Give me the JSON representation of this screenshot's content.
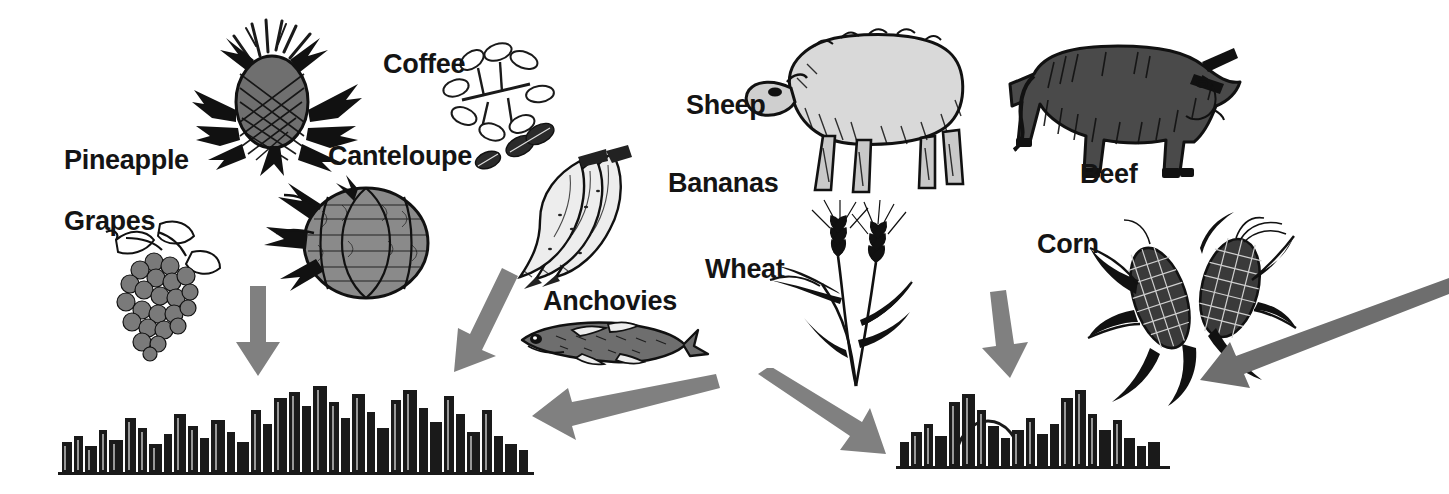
{
  "diagram": {
    "background_color": "#FFFFFF",
    "label_color": "#141414",
    "arrow_color": "#808080",
    "arrow_color_dark": "#6E6E6E",
    "ink_color": "#1A1A1A",
    "fill_gray": "#808080",
    "fill_light": "#D9D9D9",
    "fill_dark": "#4D4D4D"
  },
  "labels": [
    {
      "id": "pineapple",
      "text": "Pineapple",
      "x": 64,
      "y": 147
    },
    {
      "id": "coffee",
      "text": "Coffee",
      "x": 383,
      "y": 51
    },
    {
      "id": "canteloupe",
      "text": "Canteloupe",
      "x": 328,
      "y": 143
    },
    {
      "id": "grapes",
      "text": "Grapes",
      "x": 64,
      "y": 208
    },
    {
      "id": "bananas",
      "text": "Bananas",
      "x": 668,
      "y": 170
    },
    {
      "id": "sheep",
      "text": "Sheep",
      "x": 686,
      "y": 92
    },
    {
      "id": "beef",
      "text": "Beef",
      "x": 1080,
      "y": 161
    },
    {
      "id": "anchovies",
      "text": "Anchovies",
      "x": 543,
      "y": 288
    },
    {
      "id": "wheat",
      "text": "Wheat",
      "x": 705,
      "y": 256
    },
    {
      "id": "corn",
      "text": "Corn",
      "x": 1037,
      "y": 231
    }
  ],
  "commodities": [
    {
      "id": "pineapple",
      "name": "Pineapple",
      "kind": "fruit",
      "label": "Pineapple"
    },
    {
      "id": "coffee",
      "name": "Coffee",
      "kind": "beverage",
      "label": "Coffee"
    },
    {
      "id": "canteloupe",
      "name": "Canteloupe",
      "kind": "fruit",
      "label": "Canteloupe"
    },
    {
      "id": "grapes",
      "name": "Grapes",
      "kind": "fruit",
      "label": "Grapes"
    },
    {
      "id": "bananas",
      "name": "Bananas",
      "kind": "fruit",
      "label": "Bananas"
    },
    {
      "id": "sheep",
      "name": "Sheep",
      "kind": "livestock",
      "label": "Sheep"
    },
    {
      "id": "beef",
      "name": "Beef",
      "kind": "livestock",
      "label": "Beef"
    },
    {
      "id": "anchovies",
      "name": "Anchovies",
      "kind": "seafood",
      "label": "Anchovies"
    },
    {
      "id": "wheat",
      "name": "Wheat",
      "kind": "grain",
      "label": "Wheat"
    },
    {
      "id": "corn",
      "name": "Corn",
      "kind": "grain",
      "label": "Corn"
    }
  ],
  "arrows": [
    {
      "id": "arrow-grapes-to-left-city",
      "from": "grapes-cluster",
      "to": "left-city",
      "direction": "down",
      "x1": 256,
      "y1": 288,
      "x2": 256,
      "y2": 372
    },
    {
      "id": "arrow-canteloupe-to-left-city",
      "from": "canteloupe",
      "to": "left-city",
      "direction": "down-left",
      "x1": 502,
      "y1": 272,
      "x2": 458,
      "y2": 368
    },
    {
      "id": "arrow-anchovies-to-left-city",
      "from": "anchovies",
      "to": "left-city",
      "direction": "left-down",
      "x1": 706,
      "y1": 383,
      "x2": 538,
      "y2": 427
    },
    {
      "id": "arrow-wheat-to-right-city",
      "from": "wheat",
      "to": "right-city",
      "direction": "right-down",
      "x1": 768,
      "y1": 380,
      "x2": 878,
      "y2": 447
    },
    {
      "id": "arrow-corn-to-right-city",
      "from": "corn",
      "to": "right-city",
      "direction": "down",
      "x1": 994,
      "y1": 297,
      "x2": 1006,
      "y2": 372
    },
    {
      "id": "arrow-offscreen-to-right-city",
      "from": "external-supply",
      "to": "right-city",
      "direction": "left-down-long",
      "x1": 1449,
      "y1": 285,
      "x2": 1212,
      "y2": 386
    }
  ],
  "destinations": [
    {
      "id": "left-city",
      "name": "City skyline (left)",
      "x": 60,
      "y": 386,
      "width": 470,
      "height": 86
    },
    {
      "id": "right-city",
      "name": "City skyline (right)",
      "x": 898,
      "y": 382,
      "width": 268,
      "height": 84
    }
  ]
}
